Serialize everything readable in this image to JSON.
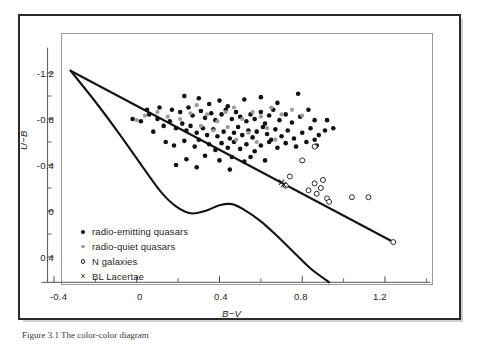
{
  "figure": {
    "caption": "Figure 3.1  The color-color diagram",
    "ylabel": "U−B",
    "xlabel": "B−V"
  },
  "legend": {
    "items": [
      {
        "marker": "filled-circle-icon",
        "label": "radio-emitting quasars"
      },
      {
        "marker": "gray-circle-icon",
        "label": "radio-quiet quasars"
      },
      {
        "marker": "open-circle-icon",
        "label": "N galaxies"
      },
      {
        "marker": "cross-icon",
        "label": "BL Lacertae"
      }
    ]
  },
  "axes": {
    "x_ticks": [
      "-0.4",
      "0",
      "0.4",
      "0.8",
      "1.2"
    ],
    "y_ticks": [
      "-1.2",
      "-0.8",
      "-0.4",
      "0",
      "0.4"
    ]
  },
  "colors": {
    "radio_emitting": "#111111",
    "radio_quiet": "#9b9b9b",
    "n_galaxies": "#2a2a2a",
    "bl_lacertae": "#222222",
    "curve": "#141414",
    "frame": "#2b2b2b",
    "plot_box": "#9a9a9a"
  },
  "chart_data": {
    "type": "scatter",
    "title": "",
    "xlabel": "B−V",
    "ylabel": "U−B",
    "xlim": [
      -0.46,
      1.42
    ],
    "ylim": [
      0.62,
      -1.42
    ],
    "x_ticks": [
      -0.4,
      0,
      0.4,
      0.8,
      1.2
    ],
    "y_ticks": [
      -1.2,
      -0.8,
      -0.4,
      0,
      0.4
    ],
    "x_minor_ticks": [
      -0.2,
      0.2,
      0.6,
      1.0,
      1.4
    ],
    "y_minor_ticks": [
      -1.0,
      -0.6,
      -0.2,
      0.2
    ],
    "grid": false,
    "y_axis_inverted": true,
    "legend_position": "inside-lower-left",
    "series": [
      {
        "name": "radio-emitting quasars",
        "marker": "filled-circle",
        "color": "#111111",
        "points": [
          [
            0.23,
            -1.0
          ],
          [
            0.3,
            -0.98
          ],
          [
            0.35,
            -0.93
          ],
          [
            0.4,
            -0.96
          ],
          [
            0.44,
            -0.91
          ],
          [
            0.52,
            -0.97
          ],
          [
            0.6,
            -0.99
          ],
          [
            0.68,
            -0.94
          ],
          [
            0.78,
            -1.02
          ],
          [
            0.17,
            -0.88
          ],
          [
            0.21,
            -0.86
          ],
          [
            0.25,
            -0.9
          ],
          [
            0.27,
            -0.83
          ],
          [
            0.31,
            -0.87
          ],
          [
            0.33,
            -0.81
          ],
          [
            0.36,
            -0.85
          ],
          [
            0.38,
            -0.79
          ],
          [
            0.41,
            -0.84
          ],
          [
            0.43,
            -0.88
          ],
          [
            0.46,
            -0.8
          ],
          [
            0.48,
            -0.86
          ],
          [
            0.5,
            -0.82
          ],
          [
            0.53,
            -0.78
          ],
          [
            0.55,
            -0.84
          ],
          [
            0.57,
            -0.8
          ],
          [
            0.6,
            -0.86
          ],
          [
            0.62,
            -0.76
          ],
          [
            0.64,
            -0.83
          ],
          [
            0.66,
            -0.88
          ],
          [
            0.69,
            -0.79
          ],
          [
            0.72,
            -0.84
          ],
          [
            0.75,
            -0.77
          ],
          [
            0.79,
            -0.82
          ],
          [
            0.83,
            -0.88
          ],
          [
            0.86,
            -0.79
          ],
          [
            0.1,
            -0.8
          ],
          [
            0.13,
            -0.74
          ],
          [
            0.16,
            -0.78
          ],
          [
            0.19,
            -0.72
          ],
          [
            0.22,
            -0.76
          ],
          [
            0.24,
            -0.7
          ],
          [
            0.26,
            -0.74
          ],
          [
            0.29,
            -0.68
          ],
          [
            0.32,
            -0.72
          ],
          [
            0.34,
            -0.66
          ],
          [
            0.37,
            -0.71
          ],
          [
            0.39,
            -0.65
          ],
          [
            0.42,
            -0.69
          ],
          [
            0.45,
            -0.63
          ],
          [
            0.47,
            -0.68
          ],
          [
            0.49,
            -0.73
          ],
          [
            0.51,
            -0.66
          ],
          [
            0.54,
            -0.7
          ],
          [
            0.56,
            -0.64
          ],
          [
            0.58,
            -0.69
          ],
          [
            0.61,
            -0.73
          ],
          [
            0.63,
            -0.67
          ],
          [
            0.65,
            -0.62
          ],
          [
            0.67,
            -0.71
          ],
          [
            0.7,
            -0.65
          ],
          [
            0.73,
            -0.7
          ],
          [
            0.76,
            -0.63
          ],
          [
            0.8,
            -0.68
          ],
          [
            0.84,
            -0.72
          ],
          [
            0.88,
            -0.66
          ],
          [
            0.91,
            -0.7
          ],
          [
            0.14,
            -0.6
          ],
          [
            0.18,
            -0.57
          ],
          [
            0.23,
            -0.61
          ],
          [
            0.28,
            -0.56
          ],
          [
            0.3,
            -0.62
          ],
          [
            0.35,
            -0.58
          ],
          [
            0.38,
            -0.53
          ],
          [
            0.41,
            -0.59
          ],
          [
            0.44,
            -0.55
          ],
          [
            0.47,
            -0.6
          ],
          [
            0.5,
            -0.54
          ],
          [
            0.53,
            -0.58
          ],
          [
            0.57,
            -0.52
          ],
          [
            0.6,
            -0.57
          ],
          [
            0.64,
            -0.6
          ],
          [
            0.68,
            -0.55
          ],
          [
            0.72,
            -0.59
          ],
          [
            0.77,
            -0.56
          ],
          [
            0.82,
            -0.6
          ],
          [
            0.87,
            -0.57
          ],
          [
            0.06,
            -0.84
          ],
          [
            0.02,
            -0.78
          ],
          [
            -0.02,
            -0.8
          ],
          [
            0.33,
            -0.48
          ],
          [
            0.4,
            -0.44
          ],
          [
            0.46,
            -0.47
          ],
          [
            0.52,
            -0.43
          ],
          [
            0.24,
            -0.45
          ],
          [
            0.19,
            -0.4
          ],
          [
            0.29,
            -0.38
          ],
          [
            0.45,
            -0.36
          ],
          [
            0.55,
            -0.47
          ],
          [
            0.62,
            -0.44
          ],
          [
            0.11,
            -0.9
          ],
          [
            0.05,
            -0.88
          ],
          [
            0.08,
            -0.69
          ],
          [
            0.92,
            -0.79
          ],
          [
            0.95,
            -0.72
          ],
          [
            0.86,
            -0.62
          ]
        ]
      },
      {
        "name": "radio-quiet quasars",
        "marker": "gray-circle",
        "color": "#9b9b9b",
        "points": [
          [
            0.1,
            -0.86
          ],
          [
            0.15,
            -0.82
          ],
          [
            0.21,
            -0.8
          ],
          [
            0.26,
            -0.85
          ],
          [
            0.29,
            -0.92
          ],
          [
            0.34,
            -0.84
          ],
          [
            0.39,
            -0.78
          ],
          [
            0.43,
            -0.86
          ],
          [
            0.47,
            -0.9
          ],
          [
            0.51,
            -0.8
          ],
          [
            0.56,
            -0.86
          ],
          [
            0.6,
            -0.82
          ],
          [
            0.65,
            -0.9
          ],
          [
            0.7,
            -0.84
          ],
          [
            0.75,
            -0.88
          ],
          [
            0.8,
            -0.83
          ],
          [
            0.31,
            -0.74
          ],
          [
            0.37,
            -0.7
          ],
          [
            0.44,
            -0.73
          ],
          [
            0.54,
            -0.68
          ],
          [
            0.63,
            -0.72
          ],
          [
            0.48,
            -0.62
          ],
          [
            0.58,
            -0.6
          ],
          [
            0.67,
            -0.62
          ],
          [
            0.04,
            -0.83
          ],
          [
            0.0,
            -0.79
          ]
        ]
      },
      {
        "name": "N galaxies",
        "marker": "open-circle",
        "color": "#2a2a2a",
        "points": [
          [
            0.74,
            -0.3
          ],
          [
            0.72,
            -0.22
          ],
          [
            0.86,
            -0.24
          ],
          [
            0.9,
            -0.27
          ],
          [
            0.83,
            -0.18
          ],
          [
            0.87,
            -0.15
          ],
          [
            0.89,
            -0.2
          ],
          [
            0.92,
            -0.11
          ],
          [
            0.93,
            -0.08
          ],
          [
            1.04,
            -0.12
          ],
          [
            1.12,
            -0.12
          ],
          [
            0.8,
            -0.44
          ],
          [
            0.86,
            -0.56
          ],
          [
            1.24,
            0.27
          ]
        ]
      },
      {
        "name": "BL Lacertae",
        "marker": "cross",
        "color": "#222222",
        "points": [
          [
            0.71,
            -0.23
          ],
          [
            0.7,
            -0.25
          ]
        ]
      }
    ],
    "curves": [
      {
        "name": "main-sequence-locus",
        "description": "lower sinuous curve from vertex, dips, rises near B-V 0.42, then falls",
        "points": [
          [
            -0.32,
            -1.22
          ],
          [
            -0.2,
            -0.95
          ],
          [
            -0.08,
            -0.66
          ],
          [
            0.03,
            -0.38
          ],
          [
            0.12,
            -0.16
          ],
          [
            0.19,
            -0.04
          ],
          [
            0.26,
            0.02
          ],
          [
            0.33,
            0.0
          ],
          [
            0.4,
            -0.05
          ],
          [
            0.46,
            -0.06
          ],
          [
            0.52,
            -0.01
          ],
          [
            0.6,
            0.09
          ],
          [
            0.68,
            0.22
          ],
          [
            0.76,
            0.36
          ],
          [
            0.84,
            0.5
          ],
          [
            0.93,
            0.62
          ]
        ]
      },
      {
        "name": "blackbody-reddening-line",
        "description": "straight line from vertex sloping down-right",
        "points": [
          [
            -0.32,
            -1.22
          ],
          [
            1.24,
            0.27
          ]
        ]
      }
    ]
  }
}
